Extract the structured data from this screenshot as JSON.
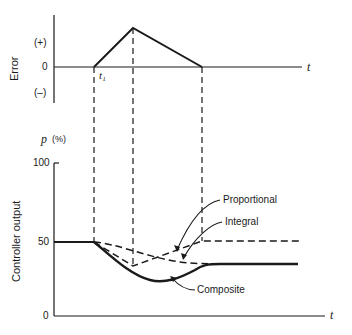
{
  "error_plot": {
    "y_label": "Error",
    "ticks": [
      "(+)",
      "0",
      "(–)"
    ],
    "x_label": "t",
    "event_label": "t₁"
  },
  "output_plot": {
    "y_label": "Controller output",
    "y_unit_label": "p",
    "y_unit_suffix": "(%)",
    "ticks": [
      "100",
      "50",
      "0"
    ],
    "x_label": "t"
  },
  "curves": {
    "proportional": "Proportional",
    "integral": "Integral",
    "composite": "Composite"
  },
  "colors": {
    "ink": "#1a1a1a",
    "background": "#ffffff"
  }
}
